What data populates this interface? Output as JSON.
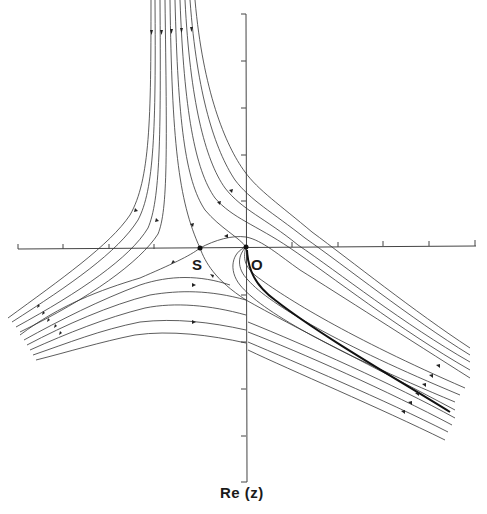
{
  "figure": {
    "points": {
      "saddle_label": "S",
      "origin_label": "O"
    },
    "axis_label": "Re (z)",
    "colors": {
      "line": "#333333",
      "background": "#ffffff",
      "emphasis_line": "#111111"
    }
  }
}
